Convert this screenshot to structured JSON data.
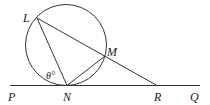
{
  "diagram": {
    "type": "geometry",
    "labels": {
      "L": "L",
      "M": "M",
      "N": "N",
      "P": "P",
      "Q": "Q",
      "R": "R",
      "angle": "θ°"
    },
    "stroke_color": "#333333"
  }
}
